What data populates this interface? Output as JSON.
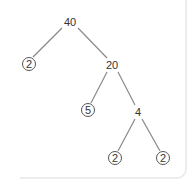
{
  "diagram": {
    "type": "factor-tree",
    "colors": {
      "line": "#8a8a8a",
      "text": "#333333",
      "circle": "#555555"
    },
    "nodes": [
      {
        "id": "n40",
        "label": "40",
        "x": 70,
        "y": 22,
        "circled": false
      },
      {
        "id": "n2a",
        "label": "2",
        "x": 29,
        "y": 64,
        "circled": true
      },
      {
        "id": "n20",
        "label": "20",
        "x": 112,
        "y": 65,
        "circled": false
      },
      {
        "id": "n5",
        "label": "5",
        "x": 88,
        "y": 110,
        "circled": true
      },
      {
        "id": "n4",
        "label": "4",
        "x": 138,
        "y": 112,
        "circled": false
      },
      {
        "id": "n2b",
        "label": "2",
        "x": 115,
        "y": 158,
        "circled": true
      },
      {
        "id": "n2c",
        "label": "2",
        "x": 163,
        "y": 158,
        "circled": true
      }
    ],
    "edges": [
      {
        "from": "n40",
        "to": "n2a"
      },
      {
        "from": "n40",
        "to": "n20"
      },
      {
        "from": "n20",
        "to": "n5"
      },
      {
        "from": "n20",
        "to": "n4"
      },
      {
        "from": "n4",
        "to": "n2b"
      },
      {
        "from": "n4",
        "to": "n2c"
      }
    ]
  }
}
